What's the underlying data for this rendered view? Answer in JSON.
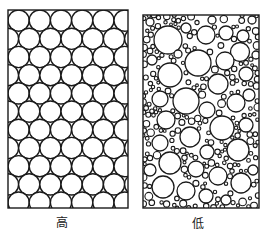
{
  "panels": [
    {
      "id": "high",
      "label": "高",
      "description": "uniform packing of equal-size circles (high)",
      "box": {
        "x": 8,
        "y": 10,
        "w": 120,
        "h": 198
      },
      "label_center_x": 62,
      "circle_radius": 10.6,
      "row_spacing": 18.2,
      "rows": 11
    },
    {
      "id": "low",
      "label": "低",
      "description": "poorly sorted packing of mixed-size circles (low)",
      "box": {
        "x": 143,
        "y": 15,
        "w": 116,
        "h": 193
      },
      "label_center_x": 198
    }
  ],
  "colors": {
    "stroke": "#1a1a1a",
    "fill": "#ffffff",
    "background": "#ffffff",
    "label": "#222222"
  }
}
